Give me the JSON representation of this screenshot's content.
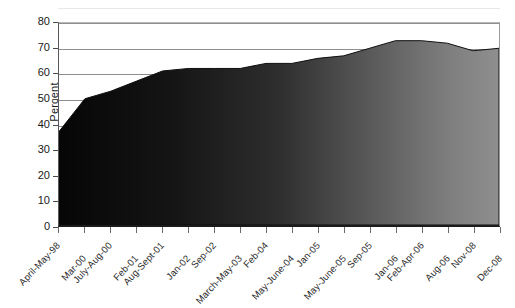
{
  "chart_data": {
    "type": "area",
    "title": "",
    "xlabel": "",
    "ylabel": "Percent",
    "ylim": [
      0,
      80
    ],
    "ytick_step": 10,
    "grid": true,
    "legend": "none",
    "fill_gradient": [
      "#0a0a0a",
      "#8a8a8a"
    ],
    "categories": [
      "April-May-98",
      "Mar-00",
      "July-Aug-00",
      "Feb-01",
      "Aug-Sept-01",
      "Jan-02",
      "Sep-02",
      "March-May-03",
      "Feb-04",
      "May-June-04",
      "Jan-05",
      "May-June-05",
      "Sep-05",
      "Jan-06",
      "Feb-Apr-06",
      "Aug-06",
      "Nov-08",
      "Dec-08"
    ],
    "values": [
      37,
      50,
      53,
      57,
      61,
      62,
      62,
      62,
      64,
      64,
      66,
      67,
      70,
      73,
      73,
      72,
      69,
      70
    ],
    "ytick_labels": [
      "0",
      "10",
      "20",
      "30",
      "40",
      "50",
      "60",
      "70",
      "80"
    ],
    "series": [
      {
        "name": "Percent",
        "values": [
          37,
          50,
          53,
          57,
          61,
          62,
          62,
          62,
          64,
          64,
          66,
          67,
          70,
          73,
          73,
          72,
          69,
          70
        ]
      }
    ]
  },
  "axis": {
    "y_title": "Percent"
  }
}
